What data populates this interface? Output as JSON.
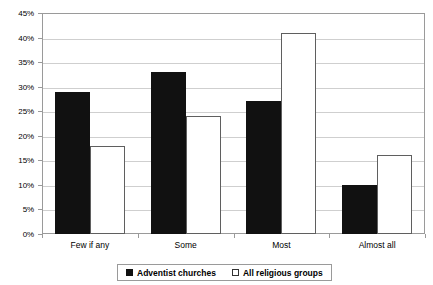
{
  "chart_data": {
    "type": "bar",
    "title": "",
    "xlabel": "",
    "ylabel": "",
    "ylim": [
      0,
      45
    ],
    "ytick_step": 5,
    "grid": true,
    "legend_position": "bottom",
    "categories": [
      "Few if any",
      "Some",
      "Most",
      "Almost all"
    ],
    "ytick_labels": [
      "0%",
      "5%",
      "10%",
      "15%",
      "20%",
      "25%",
      "30%",
      "35%",
      "40%",
      "45%"
    ],
    "ytick_values": [
      0,
      5,
      10,
      15,
      20,
      25,
      30,
      35,
      40,
      45
    ],
    "series": [
      {
        "name": "Adventist churches",
        "style": "filled",
        "color": "#111111",
        "values": [
          29,
          33,
          27,
          10
        ]
      },
      {
        "name": "All religious groups",
        "style": "outline",
        "color": "#ffffff",
        "border_color": "#5f5f5f",
        "values": [
          18,
          24,
          41,
          16
        ]
      }
    ]
  },
  "legend": {
    "entries": [
      {
        "label": "Adventist churches",
        "style": "filled"
      },
      {
        "label": "All religious groups",
        "style": "outline"
      }
    ]
  },
  "colors": {
    "series_filled": "#111111",
    "series_outline_border": "#5f5f5f",
    "gridline": "#cfcfcf",
    "axis": "#9a9a9a",
    "background": "#ffffff",
    "text": "#000000"
  }
}
